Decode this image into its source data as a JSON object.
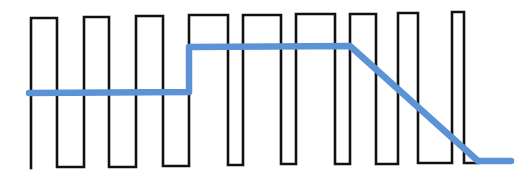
{
  "diagram": {
    "colors": {
      "background": "#ffffff",
      "pwm_wave": "#111111",
      "average_line": "#5b93d6"
    },
    "pwm_wave": {
      "start": {
        "x": 31,
        "y": 168
      },
      "pulses": [
        {
          "rise": 31,
          "fall": 57,
          "top": 18,
          "bottom": 167
        },
        {
          "rise": 84,
          "fall": 109,
          "top": 17,
          "bottom": 167
        },
        {
          "rise": 136,
          "fall": 163,
          "top": 16,
          "bottom": 166
        },
        {
          "rise": 189,
          "fall": 228,
          "top": 15,
          "bottom": 165
        },
        {
          "rise": 243,
          "fall": 281,
          "top": 15,
          "bottom": 164
        },
        {
          "rise": 296,
          "fall": 335,
          "top": 14,
          "bottom": 164
        },
        {
          "rise": 350,
          "fall": 376,
          "top": 14,
          "bottom": 164
        },
        {
          "rise": 398,
          "fall": 418,
          "top": 13,
          "bottom": 163
        },
        {
          "rise": 452,
          "fall": 464,
          "top": 12,
          "bottom": 163
        }
      ],
      "end_x": 478
    },
    "average_line": {
      "points": [
        [
          29,
          93
        ],
        [
          189,
          92
        ],
        [
          189,
          47
        ],
        [
          350,
          46
        ],
        [
          478,
          161
        ],
        [
          511,
          161
        ]
      ]
    }
  }
}
